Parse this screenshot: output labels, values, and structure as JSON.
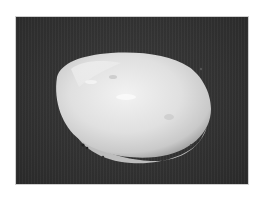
{
  "caption": {
    "text": "",
    "note": "cut-off caption text at top edge, illegible"
  },
  "photo": {
    "subject": "white ovoid specimen on dark background",
    "background_color": "#303030",
    "specimen_color": "#e6e6e6"
  }
}
